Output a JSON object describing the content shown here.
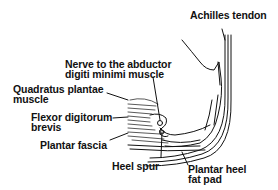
{
  "diagram": {
    "colors": {
      "line": "#111111",
      "background": "#ffffff"
    },
    "labels": {
      "achilles": "Achilles tendon",
      "nerve_line1": "Nerve to the abductor",
      "nerve_line2": "digiti minimi muscle",
      "quadratus_line1": "Quadratus plantae",
      "quadratus_line2": "muscle",
      "flexor_line1": "Flexor digitorum",
      "flexor_line2": "brevis",
      "plantar_fascia": "Plantar fascia",
      "heel_spur": "Heel spur",
      "fat_pad_line1": "Plantar heel",
      "fat_pad_line2": "fat pad"
    }
  }
}
